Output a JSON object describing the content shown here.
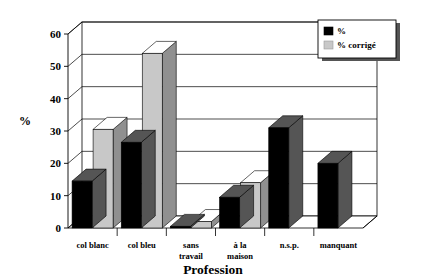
{
  "chart_data": {
    "type": "bar",
    "title": "",
    "xlabel": "Profession",
    "ylabel": "%",
    "categories": [
      "col blanc",
      "col bleu",
      "sans travail",
      "à la maison",
      "n.s.p.",
      "manquant"
    ],
    "series": [
      {
        "name": "%",
        "values": [
          14.5,
          26.5,
          0.5,
          9.5,
          31,
          20
        ]
      },
      {
        "name": "% corrigé",
        "values": [
          30.5,
          54,
          2,
          14,
          0,
          0
        ]
      }
    ],
    "ylim": [
      0,
      60
    ],
    "yticks": [
      0,
      10,
      20,
      30,
      40,
      50,
      60
    ],
    "ytick_labels": [
      "0",
      "10",
      "20",
      "30",
      "40",
      "50",
      "60"
    ],
    "grid": true,
    "legend_position": "top-right",
    "legend_entries": [
      "%",
      "% corrigé"
    ],
    "style": "3d-bar"
  },
  "colors": {
    "series_1": "#000000",
    "series_2": "#c8c8c8",
    "series_1_side": "#555555",
    "series_2_side": "#909090",
    "series_2_top": "#ffffff",
    "grid": "#000000",
    "background": "#ffffff",
    "legend_shadow": "#555555"
  },
  "axis": {
    "y_title": "%",
    "x_title": "Profession"
  },
  "category_lines": {
    "c0": [
      "col blanc"
    ],
    "c1": [
      "col bleu"
    ],
    "c2": [
      "sans",
      "travail"
    ],
    "c3": [
      "à la",
      "maison"
    ],
    "c4": [
      "n.s.p."
    ],
    "c5": [
      "manquant"
    ]
  }
}
